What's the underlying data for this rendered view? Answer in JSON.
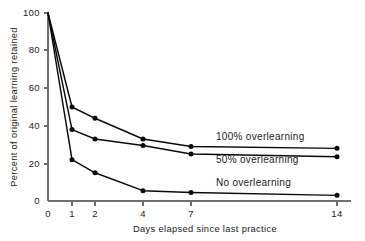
{
  "chart_data": {
    "type": "line",
    "title": "",
    "xlabel": "Days elapsed since last practice",
    "ylabel": "Percent of original learning retained",
    "x": [
      0,
      1,
      2,
      4,
      7,
      14
    ],
    "x_tick_labels": [
      "0",
      "1",
      "2",
      "4",
      "7",
      "14"
    ],
    "y_tick_labels": [
      "0",
      "20",
      "40",
      "60",
      "80",
      "100"
    ],
    "y_ticks": [
      0,
      20,
      40,
      60,
      80,
      100
    ],
    "ylim": [
      0,
      100
    ],
    "xlim": [
      0,
      14
    ],
    "x_scale": "ordinal-compressed",
    "grid": false,
    "legend_position": "inline-right",
    "series": [
      {
        "name": "100% overlearning",
        "values": [
          100,
          50,
          44,
          33,
          29,
          28
        ],
        "color": "#0a0a0a",
        "marker": "circle"
      },
      {
        "name": "50% overlearning",
        "values": [
          100,
          38,
          33,
          29.5,
          25,
          23.5
        ],
        "color": "#0a0a0a",
        "marker": "circle"
      },
      {
        "name": "No overlearning",
        "values": [
          100,
          22,
          15,
          5.5,
          4.5,
          3
        ],
        "color": "#0a0a0a",
        "marker": "circle"
      }
    ],
    "annotations": [
      {
        "text": "100% overlearning",
        "x_px": 216,
        "y_px": 140
      },
      {
        "text": "50% overlearning",
        "x_px": 216,
        "y_px": 163
      },
      {
        "text": "No overlearning",
        "x_px": 216,
        "y_px": 186
      }
    ]
  },
  "axes": {
    "y_title": "Percent of original learning retained",
    "x_title": "Days elapsed since last practice"
  },
  "y_ticks": [
    {
      "label": "100",
      "y_px": 13
    },
    {
      "label": "80",
      "y_px": 50
    },
    {
      "label": "60",
      "y_px": 88
    },
    {
      "label": "40",
      "y_px": 126
    },
    {
      "label": "20",
      "y_px": 164
    },
    {
      "label": "0",
      "y_px": 201
    }
  ],
  "x_ticks": [
    {
      "label": "0",
      "x_px": 48
    },
    {
      "label": "1",
      "x_px": 72
    },
    {
      "label": "2",
      "x_px": 95
    },
    {
      "label": "4",
      "x_px": 143
    },
    {
      "label": "7",
      "x_px": 191
    },
    {
      "label": "14",
      "x_px": 337
    }
  ],
  "colors": {
    "background": "#ffffff",
    "ink": "#0a0a0a",
    "axis": "#6e6e6e"
  }
}
